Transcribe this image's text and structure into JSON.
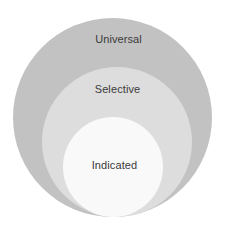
{
  "diagram": {
    "type": "nested-circles",
    "background_color": "#ffffff",
    "label_color": "#3b3b3b",
    "levels": [
      {
        "id": "universal",
        "label": "Universal",
        "color": "#c2c2c2",
        "order": 1,
        "scope": "outermost"
      },
      {
        "id": "selective",
        "label": "Selective",
        "color": "#dddddd",
        "order": 2,
        "scope": "middle"
      },
      {
        "id": "indicated",
        "label": "Indicated",
        "color": "#f9f9f9",
        "order": 3,
        "scope": "innermost"
      }
    ]
  }
}
